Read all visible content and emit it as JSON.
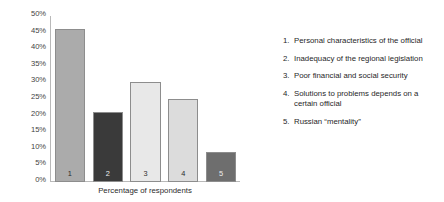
{
  "chart_data": {
    "type": "bar",
    "title": "",
    "subtitle": "",
    "xlabel": "Percentage of respondents",
    "ylabel": "",
    "categories": [
      "1",
      "2",
      "3",
      "4",
      "5"
    ],
    "values": [
      46,
      21,
      30,
      25,
      9
    ],
    "value_suffix": "%",
    "ylim": [
      0,
      50
    ],
    "ytick_step": 5,
    "ytick_labels": [
      "50%",
      "45%",
      "40%",
      "35%",
      "30%",
      "25%",
      "20%",
      "15%",
      "10%",
      "5%",
      "0%"
    ],
    "grid": false,
    "legend_position": "right",
    "bar_colors": [
      "#ababab",
      "#3a3a3a",
      "#e8e8e8",
      "#dcdcdc",
      "#6e6e6e"
    ],
    "bar_border_color": "#8d8d8d",
    "axis_color": "#b9b9b9",
    "bars": [
      {
        "category": "1",
        "value": 46,
        "color": "#ababab",
        "tone": "light"
      },
      {
        "category": "2",
        "value": 21,
        "color": "#3a3a3a",
        "tone": "dark"
      },
      {
        "category": "3",
        "value": 30,
        "color": "#e8e8e8",
        "tone": "light"
      },
      {
        "category": "4",
        "value": 25,
        "color": "#dcdcdc",
        "tone": "light"
      },
      {
        "category": "5",
        "value": 9,
        "color": "#6e6e6e",
        "tone": "mid"
      }
    ],
    "legend": [
      {
        "num": "1.",
        "label": "Personal characteristics of the official"
      },
      {
        "num": "2.",
        "label": "Inadequacy of the regional legislation"
      },
      {
        "num": "3.",
        "label": "Poor financial and social security"
      },
      {
        "num": "4.",
        "label": "Solutions to problems depends on a certain official"
      },
      {
        "num": "5.",
        "label": "Russian “mentality”"
      }
    ]
  }
}
